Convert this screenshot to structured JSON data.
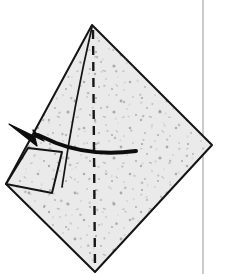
{
  "figure": {
    "canvas": {
      "width": 228,
      "height": 274
    },
    "colors": {
      "background": "#ffffff",
      "paper_fill": "#e9e9e9",
      "paper_fill_light": "#efefef",
      "speckle": "#8d8d8d",
      "outline": "#141414",
      "crease_dash": "#171717",
      "arrow": "#0d0d0d",
      "guide_line": "#a9a9a9"
    },
    "shapes": {
      "main_sheet": {
        "name": "kite-shaped paper sheet",
        "points": "92,25 212,145 95,272 6,184",
        "stroke_width": 2.0
      },
      "center_crease": {
        "name": "vertical dashed center crease",
        "x1": 93,
        "y1": 30,
        "x2": 95,
        "y2": 270,
        "dash_pattern": "9 7",
        "stroke_width": 2.4
      },
      "inner_fold_line": {
        "name": "inner slanted fold line",
        "path": "M 92,27 C 82,70 72,118 62,187",
        "stroke_width": 1.7
      },
      "left_flap": {
        "name": "small folded flap quadrilateral",
        "points": "28,148 62,152 52,193 6,184",
        "stroke_width": 2.0
      },
      "arrow": {
        "name": "curved fold-direction arrow",
        "path": "M 136,151 C 100,153 66,152 34,139",
        "stroke_width": 4.0,
        "head": "10,125 42,140 31,145"
      },
      "guide_line": {
        "name": "vertical page guide line",
        "x1": 203,
        "y1": 0,
        "x2": 203,
        "y2": 274,
        "stroke_width": 1.2
      }
    },
    "labels": {
      "step_caption": "",
      "annotation": ""
    }
  }
}
